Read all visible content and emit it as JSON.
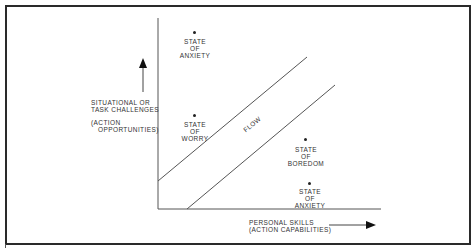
{
  "diagram": {
    "y_axis": {
      "label_line1": "SITUATIONAL OR",
      "label_line2": "TASK CHALLENGES",
      "sublabel_line1": "(ACTION",
      "sublabel_line2": "OPPORTUNITIES)"
    },
    "x_axis": {
      "label_line1": "PERSONAL SKILLS",
      "label_line2": "(ACTION CAPABILITIES)"
    },
    "channel_label": "FLOW",
    "states": [
      {
        "line1": "STATE",
        "line2": "OF",
        "line3": "ANXIETY",
        "position": "top-left"
      },
      {
        "line1": "STATE",
        "line2": "OF",
        "line3": "WORRY",
        "position": "middle-left"
      },
      {
        "line1": "STATE",
        "line2": "OF",
        "line3": "BOREDOM",
        "position": "middle-right"
      },
      {
        "line1": "STATE",
        "line2": "OF",
        "line3": "ANXIETY",
        "position": "bottom-right"
      }
    ],
    "colors": {
      "ink": "#2a2a2a",
      "background": "#ffffff"
    }
  }
}
